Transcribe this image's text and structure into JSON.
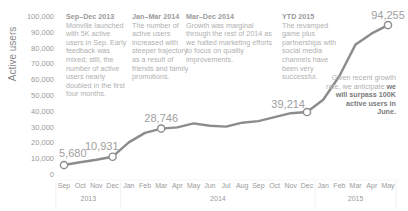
{
  "chart_data": {
    "type": "line",
    "title": "",
    "xlabel": "",
    "ylabel": "Active users",
    "ylim": [
      0,
      100000
    ],
    "yticks": [
      0,
      10000,
      20000,
      30000,
      40000,
      50000,
      60000,
      70000,
      80000,
      90000,
      100000
    ],
    "ytick_labels": [
      "0",
      "10,000",
      "20,000",
      "30,000",
      "40,000",
      "50,000",
      "60,000",
      "70,000",
      "80,000",
      "90,000",
      "100,000"
    ],
    "grid": false,
    "x": [
      "Sep",
      "Oct",
      "Nov",
      "Dec",
      "Jan",
      "Feb",
      "Mar",
      "Apr",
      "May",
      "Jun",
      "Jul",
      "Aug",
      "Sep",
      "Oct",
      "Nov",
      "Dec",
      "Jan",
      "Feb",
      "Mar",
      "Apr",
      "May"
    ],
    "years": [
      {
        "label": "2013",
        "start": 0,
        "end": 3
      },
      {
        "label": "2014",
        "start": 4,
        "end": 15
      },
      {
        "label": "2015",
        "start": 16,
        "end": 20
      }
    ],
    "series": [
      {
        "name": "Active users",
        "color": "#8c8c8c",
        "values": [
          5680,
          7500,
          9000,
          10931,
          20000,
          26000,
          28746,
          29500,
          32000,
          30500,
          30000,
          32500,
          33500,
          36000,
          38500,
          39214,
          47000,
          62000,
          82000,
          89000,
          94255
        ]
      }
    ],
    "highlighted_points": [
      {
        "index": 0,
        "label": "5,680"
      },
      {
        "index": 3,
        "label": "10,931"
      },
      {
        "index": 6,
        "label": "28,746"
      },
      {
        "index": 15,
        "label": "39,214"
      },
      {
        "index": 20,
        "label": "94,255"
      }
    ],
    "annotations": [
      {
        "heading": "Sep–Dec 2013",
        "text": "Monville launched with 5K active users in Sep. Early feedback was mixed; still, the number of active users nearly doubled in the first four months."
      },
      {
        "heading": "Jan–Mar 2014",
        "text": "The number of active users increased with steeper trajectory as a result of friends and family promotions."
      },
      {
        "heading": "Mar–Dec 2014",
        "text": "Growth was marginal through the rest of 2014 as we halted marketing efforts to focus on quality improvements."
      },
      {
        "heading": "YTD 2015",
        "text": "The revamped game plus partnerships with social media channels have been very successful."
      },
      {
        "heading": "",
        "text": "Given recent growth rate, we anticipate ",
        "bold": "we will surpass 100K active users in June."
      }
    ]
  }
}
